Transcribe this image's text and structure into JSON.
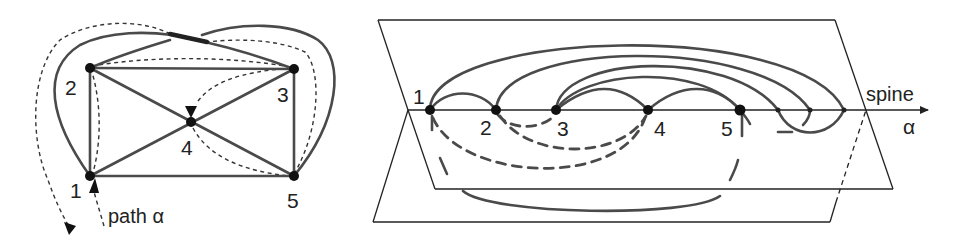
{
  "figure": {
    "left_panel": {
      "title": "graph drawing with path",
      "vertices": [
        {
          "id": "1",
          "label": "1"
        },
        {
          "id": "2",
          "label": "2"
        },
        {
          "id": "3",
          "label": "3"
        },
        {
          "id": "4",
          "label": "4"
        },
        {
          "id": "5",
          "label": "5"
        }
      ],
      "edges": [
        [
          "1",
          "2"
        ],
        [
          "2",
          "3"
        ],
        [
          "3",
          "5"
        ],
        [
          "1",
          "5"
        ],
        [
          "2",
          "4"
        ],
        [
          "4",
          "5"
        ],
        [
          "1",
          "4"
        ],
        [
          "4",
          "3"
        ],
        [
          "1",
          "3"
        ],
        [
          "2",
          "5"
        ]
      ],
      "path_label": "path α"
    },
    "right_panel": {
      "title": "book embedding",
      "spine_label": "spine",
      "axis_label": "α",
      "vertices": [
        {
          "id": "1",
          "label": "1"
        },
        {
          "id": "2",
          "label": "2"
        },
        {
          "id": "3",
          "label": "3"
        },
        {
          "id": "4",
          "label": "4"
        },
        {
          "id": "5",
          "label": "5"
        }
      ],
      "pages": [
        "upper page",
        "lower page"
      ],
      "colors": {
        "edge": "#4a4a4a",
        "plane": "#222222",
        "vertex": "#111111"
      }
    }
  }
}
